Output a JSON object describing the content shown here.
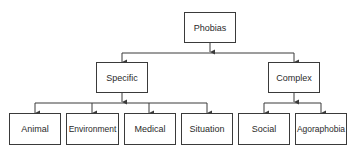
{
  "diagram": {
    "type": "hierarchy",
    "root": {
      "id": "phobias",
      "label": "Phobias"
    },
    "level1": [
      {
        "id": "specific",
        "label": "Specific"
      },
      {
        "id": "complex",
        "label": "Complex"
      }
    ],
    "level2": [
      {
        "id": "animal",
        "label": "Animal",
        "parent": "specific"
      },
      {
        "id": "environment",
        "label": "Environment",
        "parent": "specific"
      },
      {
        "id": "medical",
        "label": "Medical",
        "parent": "specific"
      },
      {
        "id": "situation",
        "label": "Situation",
        "parent": "specific"
      },
      {
        "id": "social",
        "label": "Social",
        "parent": "complex"
      },
      {
        "id": "agoraphobia",
        "label": "Agoraphobia",
        "parent": "complex"
      }
    ],
    "colors": {
      "line": "#3a3a3a",
      "text": "#2a2a2a",
      "background": "#ffffff"
    }
  }
}
